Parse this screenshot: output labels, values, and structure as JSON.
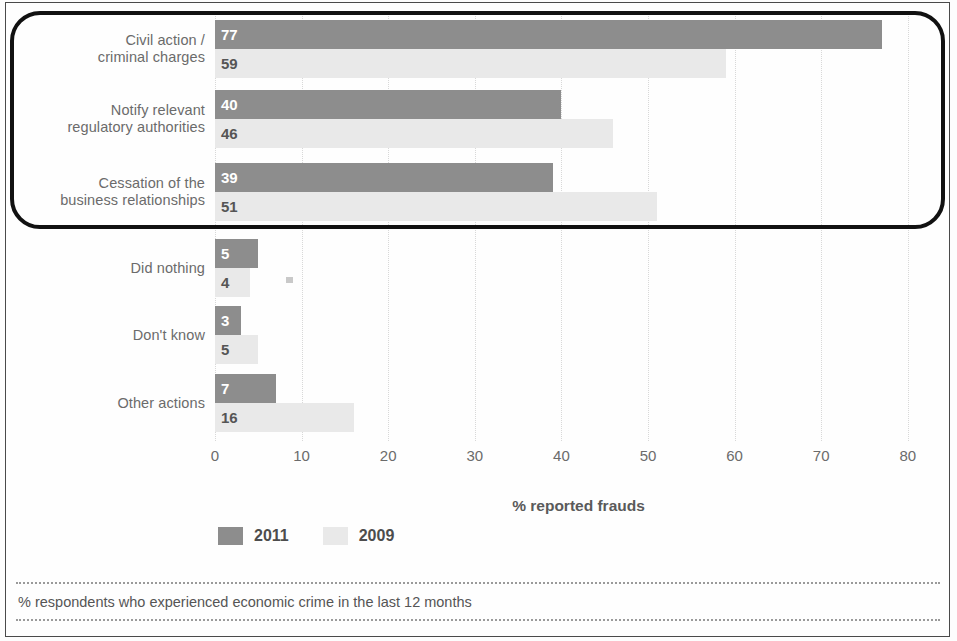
{
  "footer": {
    "note": "% respondents who experienced economic crime in the last 12 months"
  },
  "legend": {
    "items": [
      {
        "label": "2011",
        "color": "#8d8d8d",
        "swatch": "legend-swatch-2011"
      },
      {
        "label": "2009",
        "color": "#e9e9e9",
        "swatch": "legend-swatch-2009"
      }
    ]
  },
  "axis": {
    "title": "% reported frauds",
    "ticks": [
      "0",
      "10",
      "20",
      "30",
      "40",
      "50",
      "60",
      "70",
      "80"
    ]
  },
  "chart_data": {
    "type": "bar",
    "orientation": "horizontal",
    "title": "",
    "xlabel": "% reported frauds",
    "ylabel": "",
    "xlim": [
      0,
      80
    ],
    "grid": true,
    "legend_position": "bottom-left",
    "categories": [
      "Civil action / criminal charges",
      "Notify relevant regulatory authorities",
      "Cessation of the business relationships",
      "Did nothing",
      "Don't know",
      "Other actions"
    ],
    "category_lines": [
      [
        "Civil action /",
        "criminal charges"
      ],
      [
        "Notify relevant",
        "regulatory authorities"
      ],
      [
        "Cessation of the",
        "business relationships"
      ],
      [
        "Did nothing"
      ],
      [
        "Don't know"
      ],
      [
        "Other actions"
      ]
    ],
    "series": [
      {
        "name": "2011",
        "color": "#8d8d8d",
        "values": [
          77,
          40,
          39,
          5,
          3,
          7
        ]
      },
      {
        "name": "2009",
        "color": "#e9e9e9",
        "values": [
          59,
          46,
          51,
          4,
          5,
          16
        ]
      }
    ],
    "highlighted_categories": [
      "Civil action / criminal charges",
      "Notify relevant regulatory authorities",
      "Cessation of the business relationships"
    ],
    "note": "% respondents who experienced economic crime in the last 12 months"
  }
}
